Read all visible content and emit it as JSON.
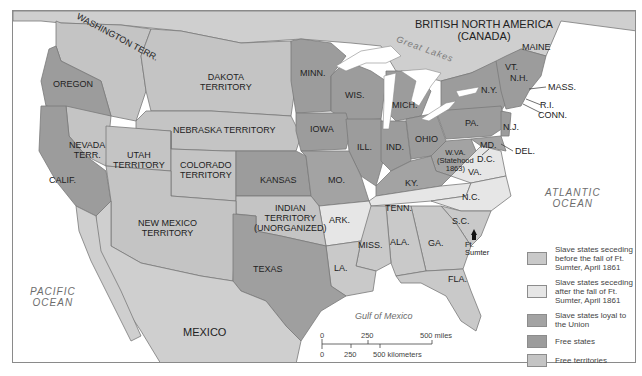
{
  "map": {
    "colors": {
      "seceding_before": "#c9c9c9",
      "seceding_after": "#e6e6e6",
      "slave_loyal": "#a3a3a3",
      "free_states": "#9c9c9c",
      "free_territories": "#c4c4c4",
      "foreign": "#cfcfcf",
      "water": "#ffffff",
      "border": "#7a7a7a"
    },
    "regions": {
      "canada": "BRITISH NORTH AMERICA\n(CANADA)",
      "great_lakes": "Great Lakes",
      "washington": "WASHINGTON TERR.",
      "oregon": "OREGON",
      "dakota": "DAKOTA\nTERRITORY",
      "minn": "MINN.",
      "wis": "WIS.",
      "mich": "MICH.",
      "ny": "N.Y.",
      "vt": "VT.",
      "nh": "N.H.",
      "maine": "MAINE",
      "mass": "MASS.",
      "ri": "R.I.",
      "conn": "CONN.",
      "nebraska": "NEBRASKA TERRITORY",
      "iowa": "IOWA",
      "ill": "ILL.",
      "ind": "IND.",
      "ohio": "OHIO",
      "pa": "PA.",
      "nj": "N.J.",
      "md": "MD.",
      "del": "DEL.",
      "dc": "D.C.",
      "wva": "W.VA.\n(Statehood\n1863)",
      "va": "VA.",
      "nevada": "NEVADA\nTERR.",
      "utah": "UTAH\nTERRITORY",
      "colorado": "COLORADO\nTERRITORY",
      "calif": "CALIF.",
      "kansas": "KANSAS",
      "mo": "MO.",
      "ky": "KY.",
      "tenn": "TENN.",
      "nc": "N.C.",
      "sc": "S.C.",
      "ark": "ARK.",
      "indian": "INDIAN\nTERRITORY\n(UNORGANIZED)",
      "new_mexico": "NEW MEXICO\nTERRITORY",
      "texas": "TEXAS",
      "la": "LA.",
      "miss": "MISS.",
      "ala": "ALA.",
      "ga": "GA.",
      "fla": "FLA.",
      "ft_sumter": "Ft.\nSumter",
      "mexico": "MEXICO",
      "pacific": "PACIFIC\nOCEAN",
      "atlantic": "ATLANTIC\nOCEAN",
      "gulf": "Gulf of Mexico"
    },
    "scale": {
      "miles_0": "0",
      "miles_250": "250",
      "miles_500": "500 miles",
      "km_0": "0",
      "km_250": "250",
      "km_500": "500 kilometers"
    },
    "legend": [
      {
        "label": "Slave states seceding before the fall of Ft. Sumter, April 1861",
        "color": "#c9c9c9"
      },
      {
        "label": "Slave states seceding after the fall of Ft. Sumter, April 1861",
        "color": "#e6e6e6"
      },
      {
        "label": "Slave states loyal to the Union",
        "color": "#a3a3a3"
      },
      {
        "label": "Free states",
        "color": "#9c9c9c"
      },
      {
        "label": "Free territories",
        "color": "#c4c4c4"
      }
    ]
  }
}
